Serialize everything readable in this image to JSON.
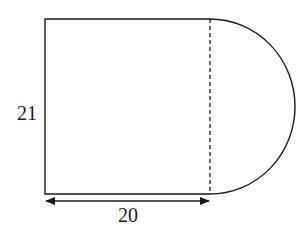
{
  "diagram": {
    "labels": {
      "height": "21",
      "width": "20"
    },
    "colors": {
      "stroke": "#1a1a1a",
      "background": "#ffffff"
    }
  }
}
